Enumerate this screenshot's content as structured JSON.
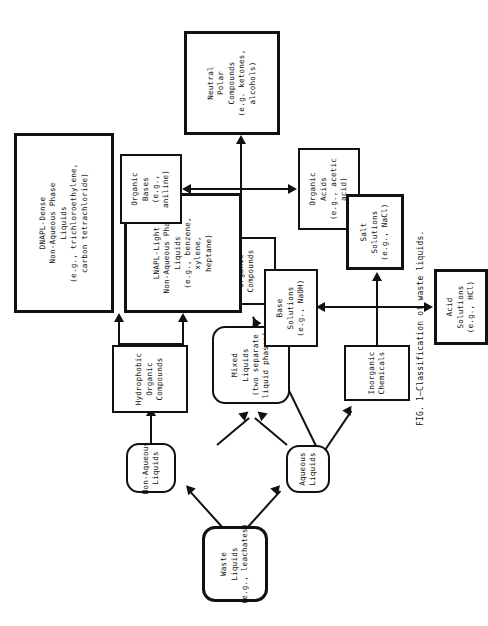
{
  "figure": {
    "caption": "FIG. 1—Classification of waste liquids.",
    "orientation_degrees": -90
  },
  "nodes": {
    "waste_liquids": {
      "lines": [
        "Waste",
        "Liquids",
        "(e.g., leachates)"
      ]
    },
    "non_aqueous": {
      "lines": [
        "Non-Aqueous",
        "Liquids"
      ]
    },
    "aqueous": {
      "lines": [
        "Aqueous",
        "Liquids"
      ]
    },
    "mixed": {
      "lines": [
        "Mixed",
        "Liquids",
        "(two separate",
        "liquid phases)"
      ]
    },
    "hydrophobic": {
      "lines": [
        "Hydrophobic",
        "Organic",
        "Compounds"
      ]
    },
    "hydrophilic": {
      "lines": [
        "Hydrophilic",
        "Organic",
        "Compounds"
      ]
    },
    "dnapl": {
      "lines": [
        "DNAPL-Dense",
        "Non-Aqueous Phase",
        "Liquids",
        "(e.g., trichloroethylene,",
        "carbon tetrachloride)"
      ]
    },
    "lnapl": {
      "lines": [
        "LNAPL-Light",
        "Non-Aqueous Phase",
        "Liquids",
        "(e.g., benzene,",
        "xylene,",
        "heptane)"
      ]
    },
    "organic_bases": {
      "lines": [
        "Organic",
        "Bases",
        "(e.g.,",
        "aniline)"
      ]
    },
    "organic_acids": {
      "lines": [
        "Organic",
        "Acids",
        "(e.g., acetic",
        "acid)"
      ]
    },
    "neutral_polar": {
      "lines": [
        "Neutral",
        "Polar",
        "Compounds",
        "(e.g. ketones,",
        "alcohols)"
      ]
    },
    "inorganic": {
      "lines": [
        "Inorganic",
        "Chemicals"
      ]
    },
    "base_solutions": {
      "lines": [
        "Base",
        "Solutions",
        "(e.g., NaOH)"
      ]
    },
    "acid_solutions": {
      "lines": [
        "Acid",
        "Solutions",
        "(e.g., HCl)"
      ]
    },
    "salt_solutions": {
      "lines": [
        "Salt",
        "Solutions",
        "(e.g., NaCl)"
      ]
    }
  },
  "colors": {
    "ink": "#111111",
    "paper": "#ffffff"
  }
}
